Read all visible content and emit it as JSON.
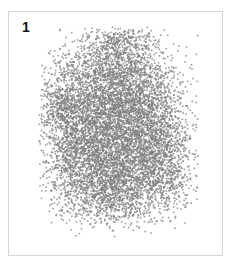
{
  "panel": {
    "label": "1"
  },
  "chart_data": {
    "type": "scatter",
    "title": "",
    "panel_label": "1",
    "xlabel": "",
    "ylabel": "",
    "axes_visible": false,
    "grid": false,
    "legend": null,
    "point_color": "#7f7f7f",
    "point_opacity": 0.75,
    "point_size_px": 1.6,
    "approx_point_count": 9000,
    "clusters": [
      {
        "cx": 105,
        "cy": 60,
        "sx": 26,
        "sy": 22,
        "n": 1400
      },
      {
        "cx": 95,
        "cy": 100,
        "sx": 30,
        "sy": 22,
        "n": 1800
      },
      {
        "cx": 100,
        "cy": 140,
        "sx": 30,
        "sy": 22,
        "n": 1800
      },
      {
        "cx": 105,
        "cy": 178,
        "sx": 26,
        "sy": 18,
        "n": 1300
      },
      {
        "cx": 140,
        "cy": 95,
        "sx": 18,
        "sy": 25,
        "n": 700
      },
      {
        "cx": 150,
        "cy": 135,
        "sx": 18,
        "sy": 22,
        "n": 700
      },
      {
        "cx": 62,
        "cy": 130,
        "sx": 14,
        "sy": 35,
        "n": 600
      },
      {
        "cx": 160,
        "cy": 165,
        "sx": 14,
        "sy": 16,
        "n": 300
      },
      {
        "cx": 50,
        "cy": 95,
        "sx": 10,
        "sy": 12,
        "n": 200
      },
      {
        "cx": 115,
        "cy": 30,
        "sx": 18,
        "sy": 8,
        "n": 200
      }
    ],
    "bounds": {
      "xmin": 30,
      "xmax": 190,
      "ymin": 15,
      "ymax": 225
    }
  }
}
